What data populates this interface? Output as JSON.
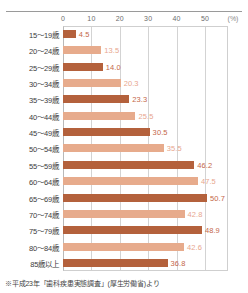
{
  "footnote": "※平成23年「歯科疾患実態調査」(厚生労働省)より",
  "colors": {
    "bar_dark": "#b4613c",
    "bar_light": "#e7ab8c",
    "value_dark": "#c4674a",
    "value_light": "#e8a68e",
    "gridline": "#d3d3d3",
    "axis": "#b9b9b9",
    "tick_text": "#6d6d6d",
    "category_text": "#3b3b3b"
  },
  "chart_data": {
    "type": "bar",
    "orientation": "horizontal",
    "title": "",
    "subtitle": "",
    "xlabel": "(%)",
    "ylabel": "",
    "unit": "(%)",
    "xlim": [
      0,
      58
    ],
    "xticks": [
      0,
      10,
      20,
      30,
      40,
      50
    ],
    "xtick_labels": [
      "0",
      "10",
      "20",
      "30",
      "40",
      "50"
    ],
    "grid": true,
    "grid_axis": "x",
    "legend": false,
    "legend_position": "none",
    "categories": [
      "15～19歳",
      "20～24歳",
      "25～29歳",
      "30～34歳",
      "35～39歳",
      "40～44歳",
      "45～49歳",
      "50～54歳",
      "55～59歳",
      "60～64歳",
      "65～69歳",
      "70～74歳",
      "75～79歳",
      "80～84歳",
      "85歳以上"
    ],
    "values": [
      4.5,
      13.5,
      14.0,
      20.3,
      23.3,
      25.5,
      30.5,
      35.5,
      46.2,
      47.5,
      50.7,
      42.8,
      48.9,
      42.6,
      36.8
    ],
    "value_labels": [
      "4.5",
      "13.5",
      "14.0",
      "20.3",
      "23.3",
      "25.5",
      "30.5",
      "35.5",
      "46.2",
      "47.5",
      "50.7",
      "42.8",
      "48.9",
      "42.6",
      "36.8"
    ],
    "bar_shades": [
      "dark",
      "light",
      "dark",
      "light",
      "dark",
      "light",
      "dark",
      "light",
      "dark",
      "light",
      "dark",
      "light",
      "dark",
      "light",
      "dark"
    ]
  }
}
